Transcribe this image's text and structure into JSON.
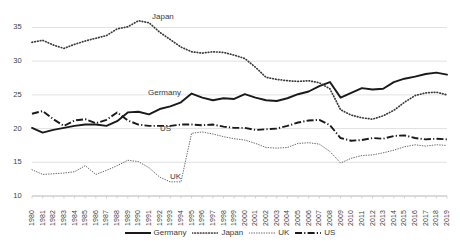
{
  "chart_data": {
    "type": "line",
    "title": "",
    "xlabel": "",
    "ylabel": "",
    "ylim": [
      10,
      37
    ],
    "yticks": [
      10,
      15,
      20,
      25,
      30,
      35
    ],
    "grid": true,
    "legend_position": "bottom",
    "x": [
      "1980",
      "1981",
      "1982",
      "1983",
      "1984",
      "1985",
      "1986",
      "1987",
      "1988",
      "1989",
      "1990",
      "1991",
      "1992",
      "1993",
      "1994",
      "1995",
      "1996",
      "1997",
      "1998",
      "1999",
      "2000",
      "2001",
      "2002",
      "2003",
      "2004",
      "2005",
      "2006",
      "2007",
      "2008",
      "2009",
      "2010",
      "2011",
      "2012",
      "2013",
      "2014",
      "2015",
      "2016",
      "2017",
      "2018",
      "2019"
    ],
    "series": [
      {
        "name": "Germany",
        "style": "solid",
        "color": "#1a1a1a",
        "values": [
          20.1,
          19.4,
          19.8,
          20.1,
          20.4,
          20.6,
          20.6,
          20.4,
          21.1,
          22.4,
          22.5,
          22.1,
          22.9,
          23.3,
          23.9,
          25.2,
          24.6,
          24.2,
          24.5,
          24.4,
          25.1,
          24.6,
          24.2,
          24.1,
          24.5,
          25.1,
          25.5,
          26.3,
          26.9,
          24.6,
          25.3,
          26.0,
          25.8,
          25.9,
          26.9,
          27.4,
          27.7,
          28.1,
          28.3,
          28.0
        ]
      },
      {
        "name": "Japan",
        "style": "dotted",
        "color": "#3a3a3a",
        "values": [
          32.8,
          33.1,
          32.4,
          31.9,
          32.5,
          33.0,
          33.4,
          33.8,
          34.8,
          35.1,
          36.0,
          35.7,
          34.3,
          33.2,
          32.1,
          31.4,
          31.2,
          31.4,
          31.3,
          30.9,
          30.4,
          29.1,
          27.6,
          27.3,
          27.1,
          27.0,
          27.1,
          26.8,
          25.9,
          22.8,
          22.0,
          21.6,
          21.4,
          21.9,
          22.7,
          23.9,
          24.9,
          25.3,
          25.4,
          25.0
        ]
      },
      {
        "name": "UK",
        "style": "fine-dotted",
        "color": "#6a6a6a",
        "values": [
          13.9,
          13.2,
          13.3,
          13.4,
          13.6,
          14.5,
          13.2,
          13.8,
          14.5,
          15.3,
          15.1,
          14.2,
          12.8,
          12.1,
          12.1,
          19.3,
          19.5,
          19.2,
          18.8,
          18.5,
          18.3,
          17.8,
          17.2,
          17.1,
          17.2,
          17.8,
          17.9,
          17.7,
          16.6,
          14.9,
          15.6,
          16.0,
          16.1,
          16.4,
          16.8,
          17.3,
          17.6,
          17.4,
          17.6,
          17.5
        ]
      },
      {
        "name": "US",
        "style": "dash-dot",
        "color": "#1a1a1a",
        "values": [
          22.2,
          22.6,
          21.4,
          20.4,
          21.2,
          21.4,
          20.8,
          21.3,
          22.4,
          21.2,
          20.6,
          20.4,
          20.4,
          20.4,
          20.6,
          20.6,
          20.5,
          20.6,
          20.3,
          20.1,
          20.1,
          19.8,
          19.9,
          20.0,
          20.4,
          20.9,
          21.2,
          21.3,
          20.5,
          18.6,
          18.2,
          18.3,
          18.6,
          18.5,
          18.9,
          19.0,
          18.6,
          18.4,
          18.5,
          18.4
        ]
      }
    ],
    "series_annotations": [
      {
        "label": "Japan",
        "x": 152,
        "y": 12
      },
      {
        "label": "Germany",
        "x": 148,
        "y": 88
      },
      {
        "label": "US",
        "x": 160,
        "y": 124
      },
      {
        "label": "UK",
        "x": 170,
        "y": 172
      }
    ]
  },
  "legend": {
    "items": [
      {
        "label": "Germany",
        "style": "solid"
      },
      {
        "label": "Japan",
        "style": "dotted"
      },
      {
        "label": "UK",
        "style": "fine-dotted"
      },
      {
        "label": "US",
        "style": "dash-dot"
      }
    ]
  }
}
